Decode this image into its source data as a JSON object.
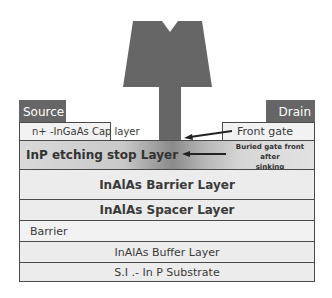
{
  "diagram": {
    "type": "HEMT cross-section",
    "contacts": {
      "source": "Source",
      "drain": "Drain"
    },
    "cap_layer": {
      "label": "n+ -InGaAs Cap layer"
    },
    "front_gate": {
      "label": "Front gate"
    },
    "etch_stop": {
      "label": "InP etching stop Layer",
      "annotation_line1": "Buried gate front after",
      "annotation_line2": "sinking"
    },
    "layers": [
      {
        "label": "InAlAs Barrier Layer"
      },
      {
        "label": "InAlAs Spacer Layer"
      },
      {
        "label": "Barrier"
      },
      {
        "label": "InAlAs Buffer Layer"
      },
      {
        "label": "S.I .- In P Substrate"
      }
    ],
    "colors": {
      "gate": "#666666",
      "contact": "#666666",
      "layer_fill": "#ececec",
      "border": "#4a4a4a",
      "text": "#3a3a3a"
    }
  }
}
